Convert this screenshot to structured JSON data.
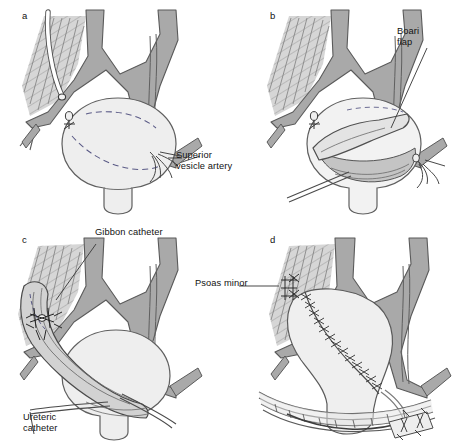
{
  "figure": {
    "background_color": "#ffffff",
    "panel_count": 4
  },
  "palette": {
    "vessel_fill": "#a9a9a9",
    "vessel_stroke": "#5a5a5a",
    "muscle_fill": "#d2d2d2",
    "muscle_hatch": "#8a8a8a",
    "bladder_fill": "#eeeeee",
    "bladder_stroke": "#5f5f5f",
    "flap_fill": "#f2f2f2",
    "lumen_fill": "#c9c9c9",
    "catheter_fill": "#ffffff",
    "line_color": "#4a4a4a",
    "text_color": "#111111",
    "suture_color": "#3a3a3a"
  },
  "panels": [
    {
      "id": "a",
      "letter": "a",
      "caption": "Bladder exposed with planned flap outlined by dashed incision",
      "labels": [
        {
          "name": "superior-vesicle-artery",
          "lines": [
            "Superior",
            "vesicle artery"
          ],
          "text": "Superior vesicle artery"
        }
      ],
      "structures": [
        "psoas-muscle",
        "iliac-vessels",
        "bladder",
        "ureteric-catheter",
        "dashed-flap-outline",
        "ligature-clip"
      ]
    },
    {
      "id": "b",
      "letter": "b",
      "caption": "Bladder opened and Boari flap raised",
      "labels": [
        {
          "name": "boari-flap",
          "lines": [
            "Boari",
            "flap"
          ],
          "text": "Boari flap"
        }
      ],
      "structures": [
        "psoas-muscle",
        "iliac-vessels",
        "bladder",
        "boari-flap",
        "bladder-lumen",
        "catheter",
        "ligature-clip"
      ]
    },
    {
      "id": "c",
      "letter": "c",
      "caption": "Flap tubularized over catheters and anastomosed to ureter",
      "labels": [
        {
          "name": "gibbon-catheter",
          "lines": [
            "Gibbon catheter"
          ],
          "text": "Gibbon catheter"
        },
        {
          "name": "ureteric-catheter",
          "lines": [
            "Ureteric",
            "catheter"
          ],
          "text": "Ureteric catheter"
        }
      ],
      "structures": [
        "psoas-muscle",
        "iliac-vessels",
        "bladder",
        "tubularized-flap",
        "anastomosis-sutures",
        "gibbon-catheter",
        "ureteric-catheter"
      ]
    },
    {
      "id": "d",
      "letter": "d",
      "caption": "Completed repair with flap sutured and wound closed",
      "labels": [
        {
          "name": "psoas-minor",
          "lines": [
            "Psoas minor"
          ],
          "text": "Psoas minor"
        }
      ],
      "structures": [
        "psoas-muscle",
        "iliac-vessels",
        "bladder",
        "sutured-flap",
        "psoas-hitch-sutures",
        "abdominal-wall-closure",
        "drain",
        "inset-detail"
      ]
    }
  ]
}
